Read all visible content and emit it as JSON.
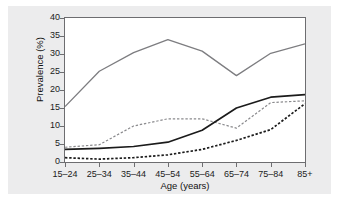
{
  "chart_data": {
    "type": "line",
    "title": "",
    "xlabel": "Age (years)",
    "ylabel": "Prevalence (%)",
    "categories": [
      "15–24",
      "25–34",
      "35–44",
      "45–54",
      "55–64",
      "65–74",
      "75–84",
      "85+"
    ],
    "ylim": [
      0,
      40
    ],
    "yticks": [
      0,
      5,
      10,
      15,
      20,
      25,
      30,
      35,
      40
    ],
    "ytick_labels": [
      "0",
      "5",
      "10",
      "15",
      "20",
      "25",
      "30",
      "35",
      "40"
    ],
    "grid": false,
    "legend": "none",
    "series": [
      {
        "name": "series-1",
        "style": "solid",
        "color": "#7d7d80",
        "width": 1.3,
        "values": [
          15.4,
          25.2,
          30.4,
          34.0,
          30.8,
          24.0,
          30.2,
          32.8
        ]
      },
      {
        "name": "series-2",
        "style": "dashed",
        "color": "#8a8a8d",
        "width": 1.2,
        "values": [
          4.1,
          4.8,
          10.0,
          12.0,
          12.0,
          9.4,
          16.5,
          17.0
        ]
      },
      {
        "name": "series-3",
        "style": "solid",
        "color": "#1b1b1b",
        "width": 1.7,
        "values": [
          3.5,
          3.8,
          4.3,
          5.5,
          8.8,
          15.0,
          18.0,
          18.7
        ]
      },
      {
        "name": "series-4",
        "style": "dashed",
        "color": "#1b1b1b",
        "width": 1.7,
        "values": [
          1.2,
          0.8,
          1.2,
          2.0,
          3.5,
          6.0,
          9.0,
          16.2
        ]
      }
    ]
  },
  "colors": {
    "figure_background": "#ececed",
    "plot_background": "#ffffff",
    "axis": "#6d6d70",
    "text": "#1b1b1b"
  }
}
